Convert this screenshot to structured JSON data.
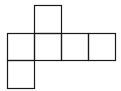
{
  "diagram": {
    "stroke_color": "#1a1a1a",
    "background": "#ffffff",
    "faces": [
      {
        "id": "face-top",
        "col": 1,
        "row": 0
      },
      {
        "id": "face-middle-1",
        "col": 0,
        "row": 1
      },
      {
        "id": "face-middle-2",
        "col": 1,
        "row": 1
      },
      {
        "id": "face-middle-3",
        "col": 2,
        "row": 1
      },
      {
        "id": "face-middle-4",
        "col": 3,
        "row": 1
      },
      {
        "id": "face-bottom",
        "col": 0,
        "row": 2
      }
    ]
  }
}
